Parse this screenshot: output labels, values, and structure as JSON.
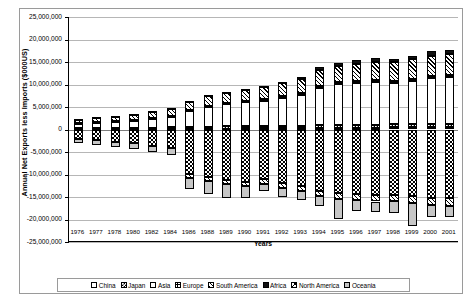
{
  "chart_data": {
    "type": "bar",
    "stacked": true,
    "title": "",
    "xlabel": "Years",
    "ylabel": "Annual Net Exports less Imports ($000US)",
    "ylim": [
      -25000000,
      25000000
    ],
    "ystep": 5000000,
    "grid": true,
    "legend_position": "bottom",
    "ytick_labels": [
      "25,000,000",
      "20,000,000",
      "15,000,000",
      "10,000,000",
      "5,000,000",
      "0",
      "-5,000,000",
      "-10,000,000",
      "-15,000,000",
      "-20,000,000",
      "-25,000,000"
    ],
    "categories": [
      "1976",
      "1977",
      "1978",
      "1980",
      "1982",
      "1984",
      "1986",
      "1988",
      "1989",
      "1990",
      "1991",
      "1992",
      "1993",
      "1994",
      "1995",
      "1996",
      "1997",
      "1998",
      "1999",
      "2000",
      "2001"
    ],
    "series": [
      {
        "name": "China",
        "pattern": "white",
        "values": [
          60000,
          70000,
          80000,
          90000,
          110000,
          130000,
          160000,
          200000,
          220000,
          240000,
          260000,
          280000,
          300000,
          330000,
          360000,
          390000,
          420000,
          450000,
          480000,
          520000,
          550000
        ]
      },
      {
        "name": "Japan",
        "pattern": "dense-check-small",
        "values": [
          180000,
          200000,
          220000,
          250000,
          300000,
          350000,
          400000,
          450000,
          480000,
          500000,
          520000,
          540000,
          560000,
          600000,
          620000,
          640000,
          660000,
          680000,
          700000,
          720000,
          740000
        ]
      },
      {
        "name": "Asia",
        "pattern": "white",
        "values": [
          1100000,
          1250000,
          1400000,
          1600000,
          1900000,
          2300000,
          3600000,
          4400000,
          4900000,
          5300000,
          5600000,
          6200000,
          6900000,
          8400000,
          9100000,
          9300000,
          9500000,
          9200000,
          9600000,
          10200000,
          10400000
        ]
      },
      {
        "name": "Europe",
        "pattern": "grid-cross",
        "values": [
          90000,
          100000,
          110000,
          120000,
          140000,
          160000,
          200000,
          240000,
          260000,
          280000,
          300000,
          320000,
          340000,
          380000,
          400000,
          420000,
          440000,
          460000,
          480000,
          500000,
          520000
        ]
      },
      {
        "name": "South America",
        "pattern": "diagonal-hatch",
        "values": [
          900000,
          1000000,
          1150000,
          1350000,
          1500000,
          1700000,
          1900000,
          2100000,
          2300000,
          2500000,
          2700000,
          2900000,
          3100000,
          3500000,
          3700000,
          3900000,
          4000000,
          4100000,
          4300000,
          4500000,
          4600000
        ]
      },
      {
        "name": "Africa",
        "pattern": "solid-black",
        "values": [
          40000,
          50000,
          60000,
          70000,
          90000,
          110000,
          140000,
          180000,
          220000,
          260000,
          300000,
          350000,
          420000,
          600000,
          700000,
          750000,
          800000,
          820000,
          850000,
          900000,
          920000
        ]
      },
      {
        "name": "North America",
        "pattern": "checkerboard",
        "values": [
          -2200000,
          -2400000,
          -2700000,
          -3100000,
          -3600000,
          -4200000,
          -9800000,
          -10600000,
          -11200000,
          -11600000,
          -11100000,
          -11900000,
          -12600000,
          -13600000,
          -14200000,
          -14400000,
          -14600000,
          -14500000,
          -14800000,
          -15200000,
          -15300000
        ]
      },
      {
        "name": "Oceania",
        "pattern": "gray",
        "values": [
          -900000,
          -1000000,
          -1100000,
          -1200000,
          -1350000,
          -1500000,
          -2600000,
          -2900000,
          -3000000,
          -2700000,
          -1600000,
          -1900000,
          -2000000,
          -2100000,
          -4300000,
          -2300000,
          -2400000,
          -2500000,
          -5200000,
          -2700000,
          -2600000
        ]
      }
    ],
    "negative_south_america": [
      0,
      0,
      0,
      0,
      0,
      0,
      -900000,
      -900000,
      -950000,
      -1000000,
      -1050000,
      -1100000,
      -1150000,
      -1250000,
      -1300000,
      -1350000,
      -1400000,
      -1450000,
      -1500000,
      -1550000,
      -1600000
    ]
  },
  "legend": {
    "items": [
      {
        "label": "China",
        "pattern_class": "p-china"
      },
      {
        "label": "Japan",
        "pattern_class": "p-japan"
      },
      {
        "label": "Asia",
        "pattern_class": "p-asia"
      },
      {
        "label": "Europe",
        "pattern_class": "p-europe"
      },
      {
        "label": "South America",
        "pattern_class": "p-southamerica"
      },
      {
        "label": "Africa",
        "pattern_class": "p-africa"
      },
      {
        "label": "North America",
        "pattern_class": "p-northamerica"
      },
      {
        "label": "Oceania",
        "pattern_class": "p-oceania"
      }
    ]
  }
}
